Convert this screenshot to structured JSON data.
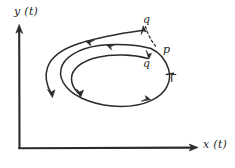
{
  "figure": {
    "kind": "phase-plane-sketch",
    "background_color": "#ffffff",
    "ink_color": "#2b2b2b",
    "axes": {
      "y_label": "y (t)",
      "x_label": "x (t)",
      "origin": [
        19,
        148
      ],
      "y_tip": [
        19,
        25
      ],
      "x_tip": [
        198,
        148
      ]
    },
    "labels": {
      "q_outer": "q",
      "p": "p",
      "q_inner": "q",
      "gamma": "Γ"
    },
    "curves": [
      {
        "name": "outer-trajectory",
        "role": "trajectory spiralling inward toward the limit cycle from outside",
        "arrow_directions": [
          "left",
          "down"
        ]
      },
      {
        "name": "limit-cycle",
        "role": "closed periodic orbit gamma",
        "arrow_directions": [
          "left",
          "right"
        ]
      },
      {
        "name": "inner-trajectory",
        "role": "trajectory spiralling outward toward the limit cycle from inside",
        "arrow_directions": [
          "left",
          "down"
        ]
      }
    ],
    "dashed_segment": {
      "name": "transversal",
      "from_label": "q_outer",
      "to_label": "p"
    }
  }
}
